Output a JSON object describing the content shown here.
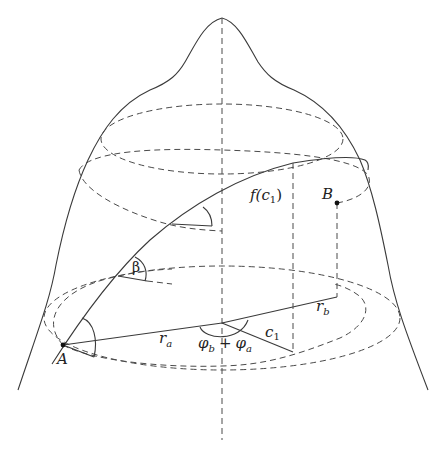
{
  "figure": {
    "colors": {
      "stroke": "#3a3a3a",
      "background": "#ffffff"
    },
    "labels": {
      "A": "A",
      "B": "B",
      "f_c1": "f(c",
      "f_c1_sub": "1",
      "f_c1_close": ")",
      "beta": "β",
      "r_a": "r",
      "r_a_sub": "a",
      "r_b": "r",
      "r_b_sub": "b",
      "c1": "c",
      "c1_sub": "1",
      "phi_b": "φ",
      "phi_b_sub": "b",
      "plus": "+",
      "phi_a": "φ",
      "phi_a_sub": "a"
    },
    "points": [
      {
        "name": "A",
        "x": 63,
        "y": 345
      },
      {
        "name": "B",
        "x": 337,
        "y": 203
      }
    ]
  }
}
